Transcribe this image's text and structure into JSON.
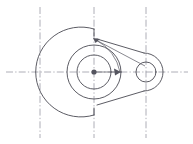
{
  "drawing": {
    "title": "Cam Plate Mechanical Part Outline",
    "type": "engineering-line-drawing",
    "canvas": {
      "width": 193,
      "height": 144
    },
    "colors": {
      "background": "#ffffff",
      "outline": "#4a4a52",
      "centerline": "#9a9aa4",
      "dimension": "#60606a",
      "marker": "#55555f"
    },
    "geometry": {
      "hub_center": {
        "x": 94,
        "y": 72
      },
      "hub_outer_radius": 45,
      "hub_bore_outer_radius": 27,
      "hub_bore_inner_radius": 17,
      "boss_center": {
        "x": 146,
        "y": 72
      },
      "boss_outer_radius": 19,
      "boss_hole_radius": 10,
      "flat_face_x": 94,
      "flat_top_y": 29,
      "flat_bottom_y": 115
    },
    "centerlines": {
      "horizontal": [
        {
          "y": 72,
          "x1": 6,
          "x2": 188
        }
      ],
      "vertical": [
        {
          "x": 40,
          "y1": 7,
          "y2": 138
        },
        {
          "x": 94,
          "y1": 7,
          "y2": 138
        },
        {
          "x": 146,
          "y1": 7,
          "y2": 138
        }
      ]
    },
    "dimensions": [
      {
        "name": "radius-hub-upper",
        "label": "",
        "from": {
          "x": 94,
          "y": 41
        },
        "to": {
          "x": 146,
          "y": 72
        },
        "arrow_at": "from"
      },
      {
        "name": "radius-hub-horizontal",
        "label": "",
        "from": {
          "x": 94,
          "y": 72
        },
        "to": {
          "x": 121,
          "y": 72
        },
        "arrow_at": "to"
      }
    ],
    "features": [
      {
        "name": "large-hub-arc",
        "description": "Large C-shaped outer arc forming left hub body"
      },
      {
        "name": "bore-outer-circle",
        "description": "Outer circle of central bore"
      },
      {
        "name": "bore-inner-circle",
        "description": "Inner circle of central bore"
      },
      {
        "name": "center-mark",
        "description": "Filled center point dot at hub axis"
      },
      {
        "name": "upper-tangent-edge",
        "description": "Straight tapered edge from hub top to boss"
      },
      {
        "name": "lower-tangent-edge",
        "description": "Straight tapered edge from hub bottom to boss"
      },
      {
        "name": "boss-outer-arc",
        "description": "Rounded end arc around right boss"
      },
      {
        "name": "boss-hole-circle",
        "description": "Through hole in right boss"
      }
    ]
  }
}
